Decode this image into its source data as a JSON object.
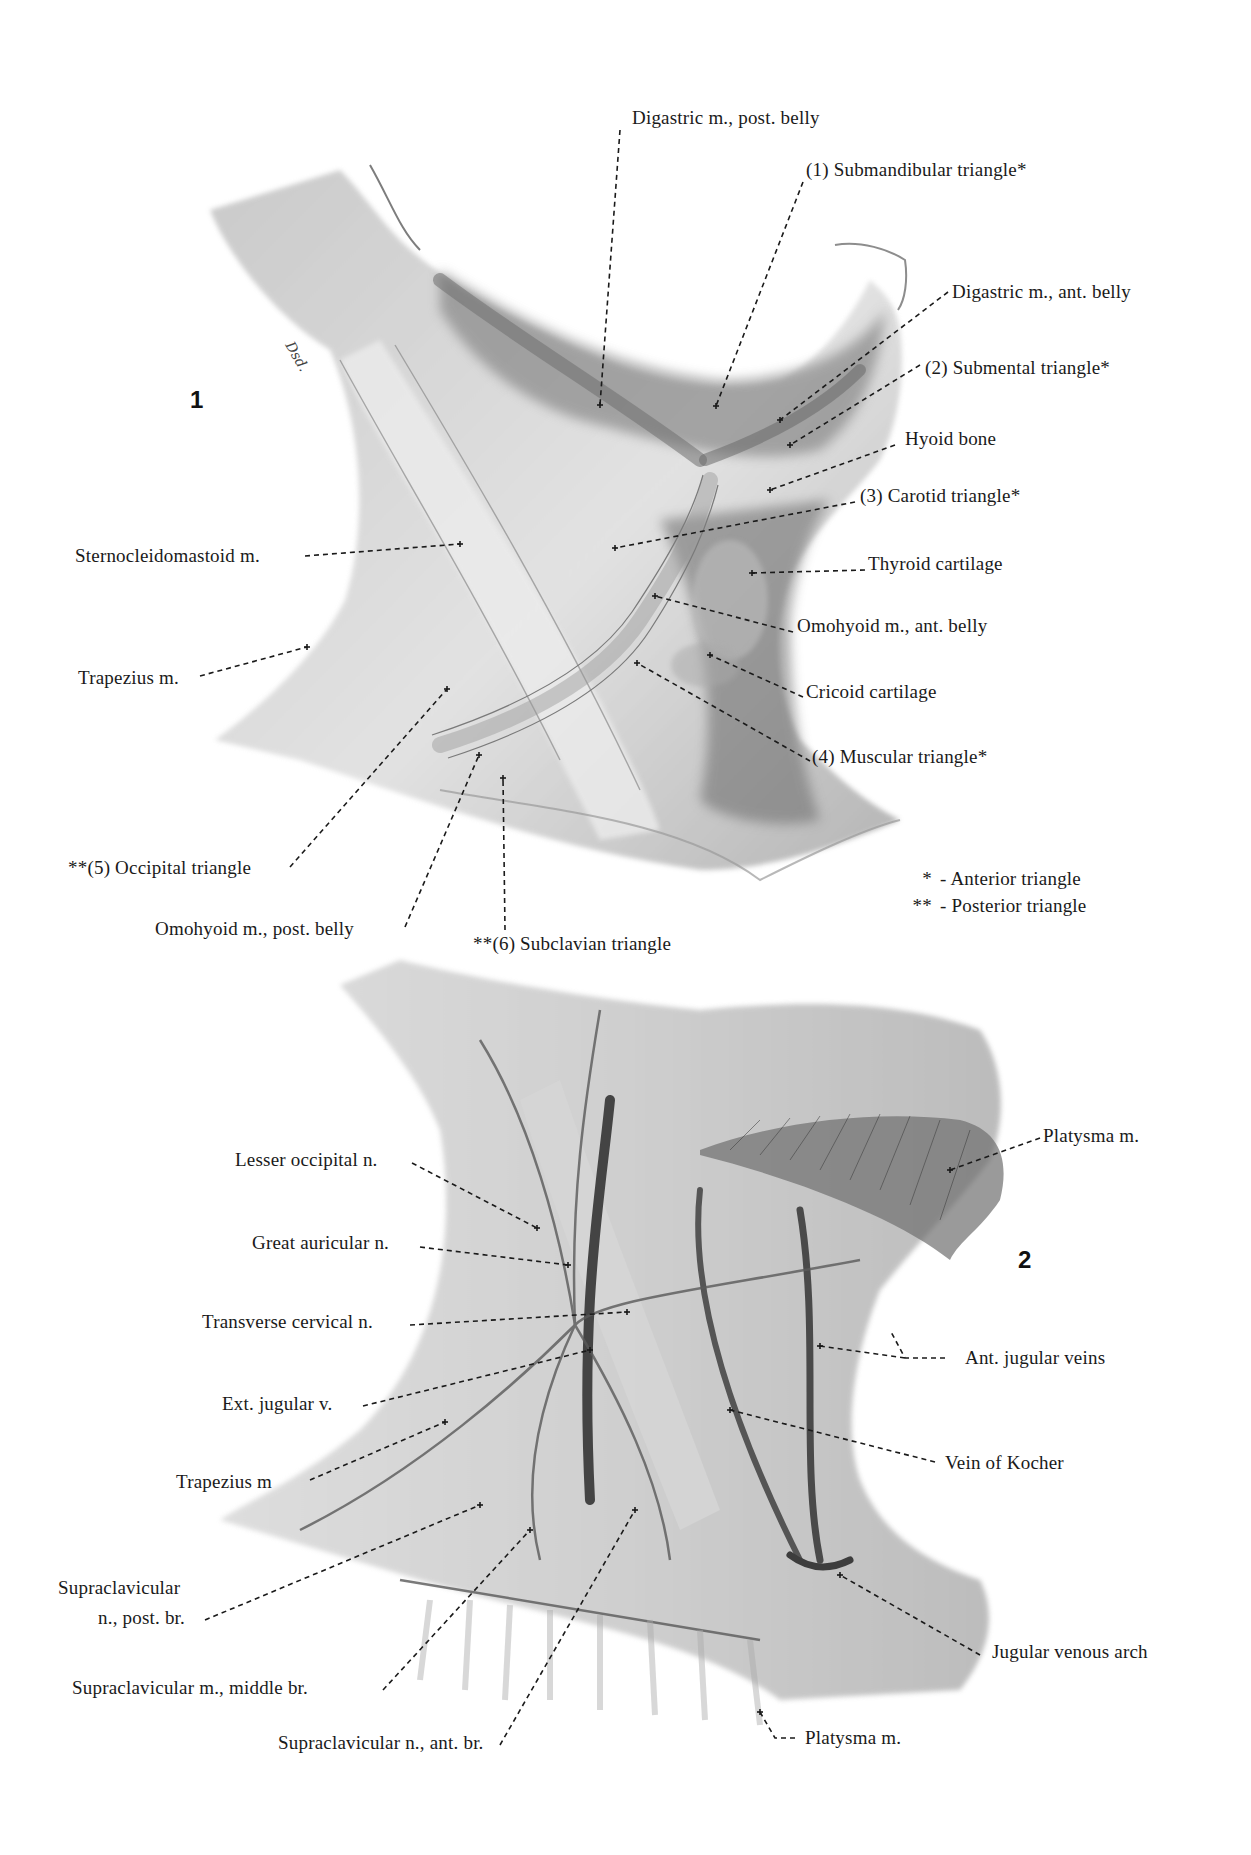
{
  "figures": [
    {
      "number": "1",
      "labels": [
        {
          "id": "digastric-post-belly",
          "text": "Digastric m., post. belly"
        },
        {
          "id": "submandibular-triangle",
          "text": "(1) Submandibular triangle*"
        },
        {
          "id": "digastric-ant-belly",
          "text": "Digastric m., ant. belly"
        },
        {
          "id": "submental-triangle",
          "text": "(2) Submental triangle*"
        },
        {
          "id": "hyoid-bone",
          "text": "Hyoid bone"
        },
        {
          "id": "carotid-triangle",
          "text": "(3) Carotid triangle*"
        },
        {
          "id": "sternocleidomastoid",
          "text": "Sternocleidomastoid m."
        },
        {
          "id": "thyroid-cartilage",
          "text": "Thyroid cartilage"
        },
        {
          "id": "omohyoid-ant-belly",
          "text": "Omohyoid m., ant. belly"
        },
        {
          "id": "trapezius",
          "text": "Trapezius m."
        },
        {
          "id": "cricoid-cartilage",
          "text": "Cricoid cartilage"
        },
        {
          "id": "muscular-triangle",
          "text": "(4) Muscular triangle*"
        },
        {
          "id": "occipital-triangle",
          "text": "**(5) Occipital triangle"
        },
        {
          "id": "omohyoid-post-belly",
          "text": "Omohyoid m., post. belly"
        },
        {
          "id": "subclavian-triangle",
          "text": "**(6) Subclavian triangle"
        }
      ],
      "legend": [
        {
          "marker": "*",
          "text": "- Anterior triangle"
        },
        {
          "marker": "**",
          "text": "- Posterior triangle"
        }
      ],
      "signature": "Dsd."
    },
    {
      "number": "2",
      "labels": [
        {
          "id": "lesser-occipital",
          "text": "Lesser occipital n."
        },
        {
          "id": "great-auricular",
          "text": "Great auricular n."
        },
        {
          "id": "transverse-cervical",
          "text": "Transverse cervical n."
        },
        {
          "id": "ext-jugular",
          "text": "Ext. jugular v."
        },
        {
          "id": "trapezius",
          "text": "Trapezius m"
        },
        {
          "id": "supraclavicular-post-1",
          "text": "Supraclavicular"
        },
        {
          "id": "supraclavicular-post-2",
          "text": "n., post. br."
        },
        {
          "id": "supraclavicular-middle",
          "text": "Supraclavicular m., middle br."
        },
        {
          "id": "supraclavicular-ant",
          "text": "Supraclavicular n., ant. br."
        },
        {
          "id": "platysma-top",
          "text": "Platysma m."
        },
        {
          "id": "ant-jugular-veins",
          "text": "Ant. jugular veins"
        },
        {
          "id": "vein-of-kocher",
          "text": "Vein of Kocher"
        },
        {
          "id": "jugular-venous-arch",
          "text": "Jugular venous arch"
        },
        {
          "id": "platysma-bottom",
          "text": "Platysma m."
        }
      ]
    }
  ]
}
